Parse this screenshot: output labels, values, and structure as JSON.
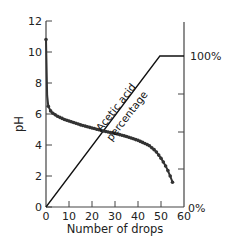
{
  "chart_data": {
    "type": "line",
    "title": "",
    "xlabel": "Number of drops",
    "ylabel": "pH",
    "y2label": "",
    "xlim": [
      0,
      60
    ],
    "ylim": [
      0,
      12
    ],
    "y2lim": [
      0,
      100
    ],
    "grid": false,
    "legend": null,
    "x_ticks": [
      "0",
      "10",
      "20",
      "30",
      "40",
      "50",
      "60"
    ],
    "y_ticks": [
      "0",
      "2",
      "4",
      "6",
      "8",
      "10",
      "12"
    ],
    "y2_ticks": [
      "0%",
      "100%"
    ],
    "series": [
      {
        "name": "pH",
        "axis": "left",
        "style": "dotted-thick",
        "x": [
          0,
          0.5,
          1,
          2,
          3,
          5,
          8,
          10,
          15,
          20,
          25,
          30,
          35,
          40,
          43,
          45,
          47,
          48,
          49,
          50,
          51,
          52,
          53,
          54,
          55
        ],
        "values": [
          10.8,
          7.2,
          6.5,
          6.2,
          6.05,
          5.85,
          5.65,
          5.55,
          5.3,
          5.1,
          4.9,
          4.75,
          4.55,
          4.3,
          4.1,
          3.95,
          3.7,
          3.55,
          3.35,
          3.15,
          2.9,
          2.65,
          2.35,
          2.0,
          1.6
        ]
      },
      {
        "name": "Acetic acid percentage",
        "axis": "right",
        "style": "solid-thin",
        "x": [
          0,
          49.5,
          60
        ],
        "values": [
          0,
          100,
          100
        ]
      }
    ],
    "annotations": [
      {
        "text_line1": "Acetic acid",
        "text_line2": "percentage",
        "x": 35,
        "y_percent": 60,
        "rotation": -52
      }
    ]
  },
  "labels": {
    "xlabel": "Number of drops",
    "ylabel": "pH",
    "annot_line1": "Acetic acid",
    "annot_line2": "percentage",
    "y2_top": "100%",
    "y2_bottom": "0%",
    "x_ticks": [
      "0",
      "10",
      "20",
      "30",
      "40",
      "50",
      "60"
    ],
    "y_ticks": [
      "0",
      "2",
      "4",
      "6",
      "8",
      "10",
      "12"
    ]
  },
  "colors": {
    "line": "#111111",
    "ph_curve": "#333333",
    "axis": "#444444"
  }
}
